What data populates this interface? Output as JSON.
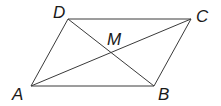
{
  "diagram": {
    "type": "parallelogram",
    "stroke_color": "#3a3a3a",
    "label_color": "#1a1a1a",
    "vertices": {
      "A": {
        "label": "A",
        "x": 31,
        "y": 86,
        "lx": 12,
        "ly": 100
      },
      "B": {
        "label": "B",
        "x": 154,
        "y": 86,
        "lx": 158,
        "ly": 100
      },
      "C": {
        "label": "C",
        "x": 191,
        "y": 19,
        "lx": 196,
        "ly": 22
      },
      "D": {
        "label": "D",
        "x": 68,
        "y": 19,
        "lx": 53,
        "ly": 18
      }
    },
    "intersection": {
      "label": "M",
      "x": 111,
      "y": 52,
      "lx": 107,
      "ly": 45
    },
    "edges": [
      [
        "A",
        "B"
      ],
      [
        "B",
        "C"
      ],
      [
        "C",
        "D"
      ],
      [
        "D",
        "A"
      ]
    ],
    "diagonals": [
      [
        "A",
        "C"
      ],
      [
        "B",
        "D"
      ]
    ]
  }
}
